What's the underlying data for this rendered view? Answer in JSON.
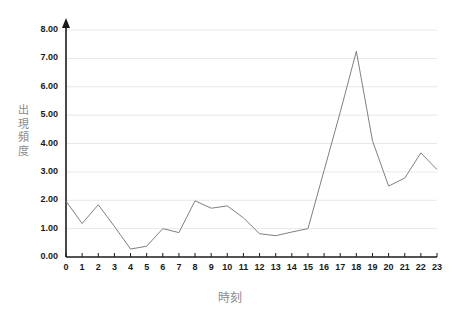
{
  "chart_data": {
    "type": "line",
    "title": "",
    "xlabel": "時刻",
    "ylabel": "出現頻度",
    "ylabel_chars": [
      "出",
      "現",
      "頻",
      "度"
    ],
    "categories": [
      "0",
      "1",
      "2",
      "3",
      "4",
      "5",
      "6",
      "7",
      "8",
      "9",
      "10",
      "11",
      "12",
      "13",
      "14",
      "15",
      "16",
      "17",
      "18",
      "19",
      "20",
      "21",
      "22",
      "23"
    ],
    "x": [
      0,
      1,
      2,
      3,
      4,
      5,
      6,
      7,
      8,
      9,
      10,
      11,
      12,
      13,
      14,
      15,
      16,
      17,
      18,
      19,
      20,
      21,
      22,
      23
    ],
    "values": [
      1.97,
      1.18,
      1.84,
      1.08,
      0.28,
      0.38,
      1.0,
      0.86,
      1.98,
      1.72,
      1.8,
      1.38,
      0.82,
      0.75,
      0.88,
      1.0,
      3.05,
      5.1,
      7.25,
      4.1,
      2.5,
      2.78,
      3.67,
      3.08
    ],
    "ylim": [
      0,
      8
    ],
    "ytick_labels": [
      "0.00",
      "1.00",
      "2.00",
      "3.00",
      "4.00",
      "5.00",
      "6.00",
      "7.00",
      "8.00"
    ],
    "ytick_values": [
      0,
      1,
      2,
      3,
      4,
      5,
      6,
      7,
      8
    ],
    "grid": true,
    "grid_axis": "y",
    "legend": false,
    "legend_position": "none",
    "line_color": "#808080",
    "grid_color": "#e8e8e8",
    "axis_color": "#1a1a1a",
    "label_color": "#8c8c8c",
    "background": "#ffffff"
  }
}
